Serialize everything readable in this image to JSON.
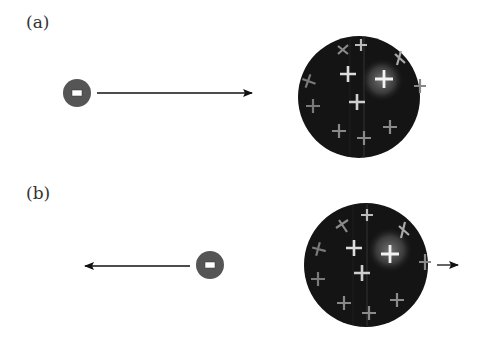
{
  "panels": [
    {
      "label": "(a)",
      "electron": {
        "sign": "-",
        "cx": 77,
        "cy": 93,
        "r": 14
      },
      "electron_arrow": {
        "direction": "right",
        "x1": 97,
        "x2": 252,
        "y": 93
      },
      "atom": {
        "cx": 359,
        "cy": 97,
        "r": 61,
        "plus_count": 14
      },
      "atom_arrow": null
    },
    {
      "label": "(b)",
      "electron": {
        "sign": "-",
        "cx": 210,
        "cy": 265,
        "r": 14
      },
      "electron_arrow": {
        "direction": "left",
        "x1": 190,
        "x2": 85,
        "y": 266
      },
      "atom": {
        "cx": 366,
        "cy": 265,
        "r": 62,
        "plus_count": 14
      },
      "atom_arrow": {
        "direction": "right",
        "x1": 437,
        "x2": 458,
        "y": 265
      }
    }
  ],
  "colors": {
    "electron_fill": "#555555",
    "sphere_dark": "#111111",
    "sphere_highlight": "#6a6a6a",
    "plus_bright": "#f0f0f0",
    "plus_dim": "#8a8a8a",
    "arrow": "#111111",
    "label_text": "#333333"
  }
}
